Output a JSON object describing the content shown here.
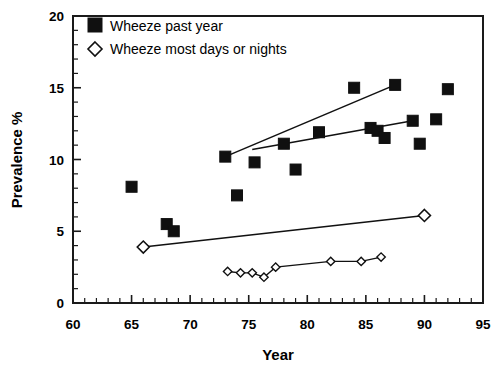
{
  "chart_data": {
    "type": "scatter",
    "title": "",
    "xlabel": "Year",
    "ylabel": "Prevalence %",
    "xlim": [
      60,
      95
    ],
    "ylim": [
      0,
      20
    ],
    "xticks": [
      60,
      65,
      70,
      75,
      80,
      85,
      90,
      95
    ],
    "yticks": [
      0,
      5,
      10,
      15,
      20
    ],
    "xtick_labels": [
      "60",
      "65",
      "70",
      "75",
      "80",
      "85",
      "90",
      "95"
    ],
    "ytick_labels": [
      "0",
      "5",
      "10",
      "15",
      "20"
    ],
    "xminor_step": 1,
    "yminor_step": 1,
    "grid": false,
    "legend_position": "top-left",
    "series": [
      {
        "name": "Wheeze past year",
        "marker": "filled-square",
        "points": [
          {
            "x": 65.0,
            "y": 8.1
          },
          {
            "x": 68.0,
            "y": 5.5
          },
          {
            "x": 68.6,
            "y": 5.0
          },
          {
            "x": 73.0,
            "y": 10.2
          },
          {
            "x": 74.0,
            "y": 7.5
          },
          {
            "x": 75.5,
            "y": 9.8
          },
          {
            "x": 78.0,
            "y": 11.1
          },
          {
            "x": 79.0,
            "y": 9.3
          },
          {
            "x": 81.0,
            "y": 11.9
          },
          {
            "x": 84.0,
            "y": 15.0
          },
          {
            "x": 85.4,
            "y": 12.2
          },
          {
            "x": 86.0,
            "y": 12.0
          },
          {
            "x": 86.6,
            "y": 11.5
          },
          {
            "x": 87.5,
            "y": 15.2
          },
          {
            "x": 89.0,
            "y": 12.7
          },
          {
            "x": 89.6,
            "y": 11.1
          },
          {
            "x": 91.0,
            "y": 12.8
          },
          {
            "x": 92.0,
            "y": 14.9
          }
        ],
        "trendlines": [
          {
            "name": "upper-square-trend",
            "x1": 73.0,
            "y1": 10.2,
            "x2": 87.5,
            "y2": 15.2
          },
          {
            "name": "lower-square-trend",
            "x1": 75.3,
            "y1": 10.7,
            "x2": 89.0,
            "y2": 12.7
          }
        ]
      },
      {
        "name": "Wheeze most days or nights",
        "marker": "open-diamond",
        "points": [
          {
            "x": 66.0,
            "y": 3.9
          },
          {
            "x": 90.0,
            "y": 6.1
          }
        ],
        "trendlines": [
          {
            "name": "diamond-trend",
            "x1": 66.0,
            "y1": 3.9,
            "x2": 90.0,
            "y2": 6.1
          }
        ],
        "connected_points": [
          {
            "x": 73.2,
            "y": 2.2
          },
          {
            "x": 74.3,
            "y": 2.1
          },
          {
            "x": 75.3,
            "y": 2.1
          },
          {
            "x": 76.3,
            "y": 1.8
          },
          {
            "x": 77.3,
            "y": 2.5
          },
          {
            "x": 82.0,
            "y": 2.9
          },
          {
            "x": 84.6,
            "y": 2.9
          },
          {
            "x": 86.3,
            "y": 3.2
          }
        ]
      }
    ],
    "legend": [
      {
        "label": "Wheeze past year",
        "marker": "filled-square"
      },
      {
        "label": "Wheeze most days or nights",
        "marker": "open-diamond"
      }
    ]
  }
}
